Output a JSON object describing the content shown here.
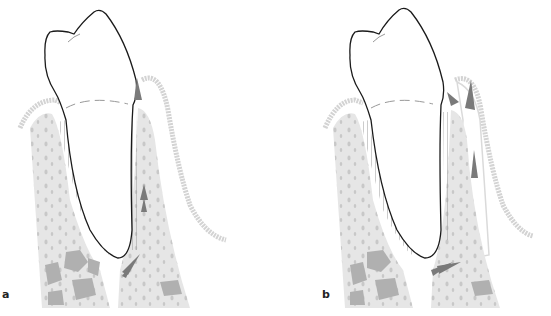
{
  "figure": {
    "panels": [
      {
        "id": "a",
        "label": "a"
      },
      {
        "id": "b",
        "label": "b"
      }
    ],
    "colors": {
      "tooth_outline": "#1a1a1a",
      "bone_fill": "#e6e6e6",
      "bone_pores": "#c8c8c8",
      "marrow": "#aaaaaa",
      "gingiva": "#cfcfcf",
      "arrows": "#7a7a7a",
      "ligament_lines": "#555555"
    }
  }
}
